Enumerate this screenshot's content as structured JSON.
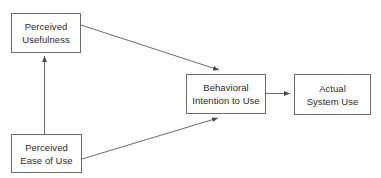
{
  "diagram": {
    "background_color": "#ffffff",
    "box_border_color": "#6b6b6b",
    "text_color": "#2b2b2b",
    "arrow_color": "#6b6b6b",
    "nodes": [
      {
        "id": "perceived-usefulness",
        "line1": "Perceived",
        "line2": "Usefulness"
      },
      {
        "id": "perceived-ease-of-use",
        "line1": "Perceived",
        "line2": "Ease of Use"
      },
      {
        "id": "behavioral-intention-to-use",
        "line1": "Behavioral",
        "line2": "Intention to Use"
      },
      {
        "id": "actual-system-use",
        "line1": "Actual",
        "line2": "System Use"
      }
    ],
    "edges": [
      {
        "id": "ease-of-use-to-usefulness",
        "from": "perceived-ease-of-use",
        "to": "perceived-usefulness",
        "label": ""
      },
      {
        "id": "usefulness-to-intention",
        "from": "perceived-usefulness",
        "to": "behavioral-intention-to-use",
        "label": ""
      },
      {
        "id": "ease-of-use-to-intention",
        "from": "perceived-ease-of-use",
        "to": "behavioral-intention-to-use",
        "label": ""
      },
      {
        "id": "intention-to-actual-use",
        "from": "behavioral-intention-to-use",
        "to": "actual-system-use",
        "label": ""
      }
    ]
  }
}
